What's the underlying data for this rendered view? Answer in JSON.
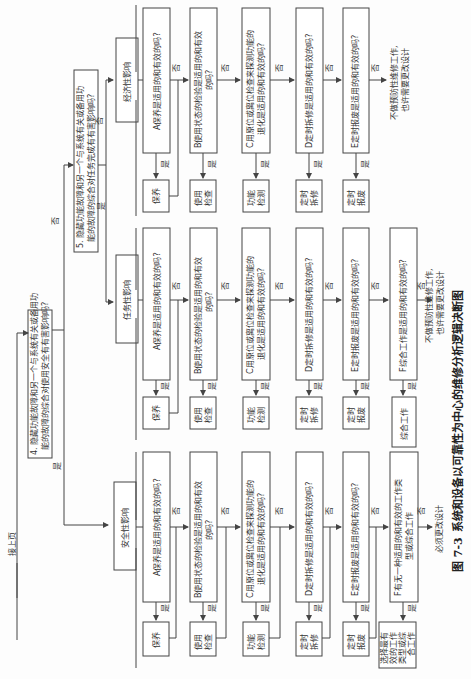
{
  "page_header": "接上页",
  "q4": {
    "line1": "4. 隐藏功能故障和另一个与系统有关或备用功",
    "line2": "能的故障的综合对使用安全有有害影响吗?"
  },
  "q5": {
    "line1": "5. 隐藏功能故障和另一个与系统有关或备用功",
    "line2": "能的故障的综合对任务完成有有害影响吗?"
  },
  "labels": {
    "yes": "是",
    "no": "否"
  },
  "categories": {
    "economic": "经济性影响",
    "mission": "任务性影响",
    "safety": "安全性影响"
  },
  "questions": {
    "A": "A保养是适用的和有效的吗?",
    "B1": "B使用状态的检验是适用的和有效",
    "B2": "的吗?",
    "C1": "C用原位或离位检查来探测功能的",
    "C2": "退化是适用的和有效的吗?",
    "D": "D定时拆修是适用的和有效的吗?",
    "E": "E定时报废是适用的和有效的吗?",
    "F_mission": "F综合工作是适用的和有效的吗?",
    "F_safety1": "F有无一种适用的和有效的工作类",
    "F_safety2": "型或综合工作"
  },
  "actions": {
    "maintenance": "保养",
    "usage_check1": "使用",
    "usage_check2": "检查",
    "function_test1": "功能",
    "function_test2": "检测",
    "overhaul1": "定时",
    "overhaul2": "拆修",
    "discard1": "定时",
    "discard2": "报废",
    "combined": "综合工作",
    "select1": "选择最有",
    "select2": "效的工作",
    "select3": "类型或综",
    "select4": "合工作"
  },
  "outcomes": {
    "no_pm_line1": "不做预防性维修工作,",
    "no_pm_line2": "也许需要更改设计",
    "must_redesign": "必须更改设计"
  },
  "caption": {
    "figure_no": "图 7-3",
    "title": "系统和设备以可靠性为中心的维修分析逻辑决断图"
  }
}
